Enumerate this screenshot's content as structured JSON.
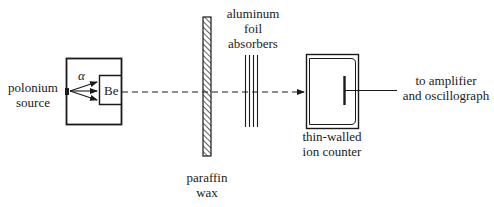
{
  "diagram": {
    "labels": {
      "source_line1": "polonium",
      "source_line2": "source",
      "alpha": "α",
      "beryllium": "Be",
      "foil_line1": "aluminum",
      "foil_line2": "foil",
      "foil_line3": "absorbers",
      "wax_line1": "paraffin",
      "wax_line2": "wax",
      "counter_line1": "thin-walled",
      "counter_line2": "ion counter",
      "output_line1": "to amplifier",
      "output_line2": "and oscillograph"
    },
    "colors": {
      "ink": "#1a1a1a",
      "background": "#ffffff"
    }
  }
}
